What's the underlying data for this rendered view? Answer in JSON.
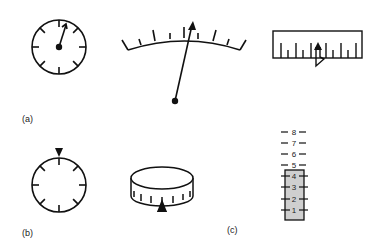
{
  "figure": {
    "labels": {
      "a": "(a)",
      "b": "(b)",
      "c": "(c)"
    },
    "panel_a": {
      "dial_gauge": {
        "type": "moving-pointer circular dial",
        "tick_count": 8
      },
      "arc_meter": {
        "type": "moving-pointer arc scale"
      },
      "linear_scale": {
        "type": "moving-pointer horizontal scale"
      }
    },
    "panel_b": {
      "fixed_pointer_dial": {
        "type": "fixed-pointer rotating circular dial"
      },
      "drum_counter": {
        "type": "fixed-pointer rotating drum scale"
      }
    },
    "panel_c": {
      "vertical_scale": {
        "type": "moving-scale vertical column",
        "numbers": [
          "8",
          "7",
          "6",
          "5",
          "4",
          "3",
          "2",
          "1"
        ],
        "filled_up_to": "4"
      }
    },
    "colors": {
      "line": "#111111",
      "fill_column": "#cfcfcf"
    }
  }
}
